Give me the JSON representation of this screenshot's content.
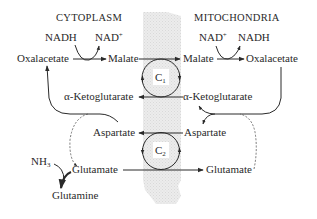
{
  "compartments": {
    "left": "CYTOPLASM",
    "right": "MITOCHONDRIA"
  },
  "cytoplasm": {
    "nadh": "NADH",
    "nad_plus": "NAD",
    "oxalacetate": "Oxalacetate",
    "malate": "Malate",
    "ketoglutarate": "α-Ketoglutarate",
    "aspartate": "Aspartate",
    "glutamate": "Glutamate",
    "nh3": "NH",
    "nh3_sub": "3",
    "glutamine": "Glutamine"
  },
  "mitochondria": {
    "nad_plus": "NAD",
    "nadh": "NADH",
    "malate": "Malate",
    "oxalacetate": "Oxalacetate",
    "ketoglutarate": "α-Ketoglutarate",
    "aspartate": "Aspartate",
    "glutamate": "Glutamate"
  },
  "carriers": {
    "c1": "C",
    "c1_sub": "1",
    "c2": "C",
    "c2_sub": "2"
  },
  "superscript_plus": "+",
  "colors": {
    "ink": "#2a2a2a",
    "membrane": "#e6e6e6"
  }
}
